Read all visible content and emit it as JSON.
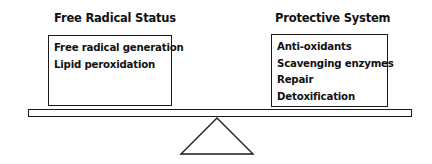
{
  "left": {
    "title": "Free Radical Status",
    "items": [
      "Free radical generation",
      "Lipid peroxidation"
    ]
  },
  "right": {
    "title": "Protective System",
    "items": [
      "Anti-oxidants",
      "Scavenging enzymes",
      "Repair",
      "Detoxification"
    ]
  },
  "colors": {
    "line": "#1a1a1a",
    "background": "#ffffff"
  }
}
